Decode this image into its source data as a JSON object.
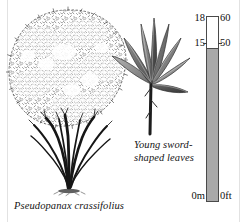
{
  "figure": {
    "kind": "botanical-illustration",
    "background_color": "#ffffff",
    "ink_color": "#141414"
  },
  "tree": {
    "species_caption": "Pseudopanax crassifolius",
    "canopy_style": "stippled-foliage",
    "trunk_count": 9
  },
  "leaf_detail": {
    "caption_line1": "Young sword-",
    "caption_line2": "shaped leaves",
    "leaf_count": 8,
    "leaf_shape": "sword-shaped"
  },
  "scale": {
    "fill_color": "#a9a9a9",
    "outline_color": "#4a4a4a",
    "ticks": [
      {
        "metric": "18",
        "imperial": "60"
      },
      {
        "metric": "15",
        "imperial": "50"
      },
      {
        "metric": "0m",
        "imperial": "0ft"
      }
    ]
  }
}
